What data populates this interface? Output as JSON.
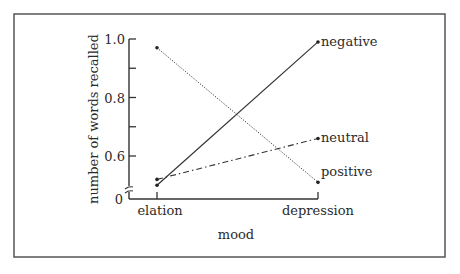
{
  "chart_data": {
    "type": "line",
    "title": "",
    "xlabel": "mood",
    "ylabel": "number of words recalled",
    "categories": [
      "elation",
      "depression"
    ],
    "ylim": [
      0.5,
      1.0
    ],
    "y_axis_break": true,
    "y_zero_label": "0",
    "yticks": [
      {
        "value": 1.0,
        "label": "1.0"
      },
      {
        "value": 0.9,
        "label": ""
      },
      {
        "value": 0.8,
        "label": "0.8"
      },
      {
        "value": 0.7,
        "label": ""
      },
      {
        "value": 0.6,
        "label": "0.6"
      }
    ],
    "grid": false,
    "legend": "inline-right",
    "series": [
      {
        "name": "negative",
        "style": "solid",
        "values": [
          0.5,
          0.99
        ]
      },
      {
        "name": "neutral",
        "style": "dash-dot",
        "values": [
          0.52,
          0.66
        ]
      },
      {
        "name": "positive",
        "style": "dotted",
        "values": [
          0.97,
          0.51
        ]
      }
    ]
  }
}
